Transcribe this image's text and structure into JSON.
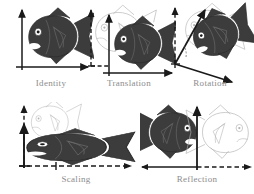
{
  "figure": {
    "background_color": "#ffffff",
    "width": 254,
    "height": 194
  },
  "colors": {
    "fish_fill": "#3c3c3c",
    "fish_stroke": "#2b2b2b",
    "fish_detail_line": "#6e6e6e",
    "fish_highlight": "#ffffff",
    "ghost_outline": "#b2b2b2",
    "axis_solid": "#1a1a1a",
    "axis_dashed": "#1a1a1a",
    "label_text": "#8c8c8c"
  },
  "panels": [
    {
      "id": "identity",
      "label": "Identity",
      "row": 1,
      "column": 1,
      "solid_fish": "present",
      "ghost_fish": "absent",
      "solid_axes": "origin-bottom-left",
      "dashed_axes": "absent"
    },
    {
      "id": "translation",
      "label": "Translation",
      "row": 1,
      "column": 2,
      "solid_fish": "present",
      "ghost_fish": "present",
      "solid_axes": "shifted-right-up",
      "dashed_axes": "original-origin"
    },
    {
      "id": "rotation",
      "label": "Rotation",
      "row": 1,
      "column": 3,
      "solid_fish": "present",
      "ghost_fish": "present",
      "solid_axes": "rotated",
      "dashed_axes": "original-origin"
    },
    {
      "id": "scaling",
      "label": "Scaling",
      "row": 2,
      "column": 1,
      "solid_fish": "present",
      "ghost_fish": "present",
      "solid_axes": "stretched-x-squashed-y",
      "dashed_axes": "original-origin"
    },
    {
      "id": "reflection",
      "label": "Reflection",
      "row": 2,
      "column": 2,
      "solid_fish": "present",
      "ghost_fish": "present",
      "solid_axes": "mirrored-x",
      "dashed_axes": "original-origin"
    }
  ]
}
